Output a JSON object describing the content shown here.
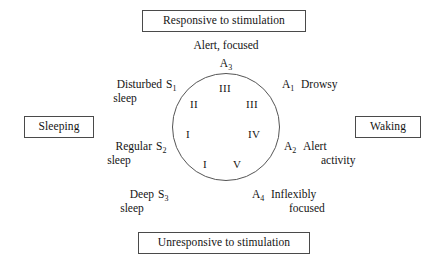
{
  "diagram": {
    "title_top": "Responsive to stimulation",
    "title_bottom": "Unresponsive to stimulation",
    "label_left": "Sleeping",
    "label_right": "Waking",
    "apex": {
      "text": "Alert, focused",
      "code_letter": "A",
      "code_sub": "3"
    },
    "states": [
      {
        "code_letter": "S",
        "code_sub": "1",
        "line1": "Disturbed",
        "line2": "sleep",
        "side": "left",
        "position": "upper-left"
      },
      {
        "code_letter": "S",
        "code_sub": "2",
        "line1": "Regular",
        "line2": "sleep",
        "side": "left",
        "position": "mid-left"
      },
      {
        "code_letter": "S",
        "code_sub": "3",
        "line1": "Deep",
        "line2": "sleep",
        "side": "left",
        "position": "lower-left"
      },
      {
        "code_letter": "A",
        "code_sub": "1",
        "line1": "Drowsy",
        "line2": "",
        "side": "right",
        "position": "upper-right"
      },
      {
        "code_letter": "A",
        "code_sub": "2",
        "line1": "Alert",
        "line2": "activity",
        "side": "right",
        "position": "mid-right"
      },
      {
        "code_letter": "A",
        "code_sub": "4",
        "line1": "Inflexibly",
        "line2": "focused",
        "side": "right",
        "position": "lower-right"
      }
    ],
    "ring_numerals": [
      {
        "label": "III",
        "position": "top-center"
      },
      {
        "label": "II",
        "position": "upper-left"
      },
      {
        "label": "III",
        "position": "upper-right"
      },
      {
        "label": "I",
        "position": "mid-left"
      },
      {
        "label": "IV",
        "position": "mid-right"
      },
      {
        "label": "I",
        "position": "bottom-left"
      },
      {
        "label": "V",
        "position": "bottom-right"
      }
    ],
    "colors": {
      "background": "#ffffff",
      "text": "#141414",
      "box_border": "#4a4a4a",
      "circle_stroke": "#555555"
    }
  }
}
